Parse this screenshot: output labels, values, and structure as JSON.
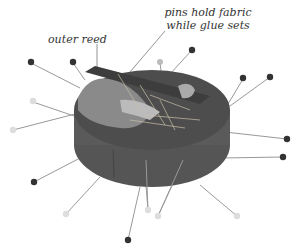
{
  "illustration": {
    "subject": "fabric-covered oval basket base with pins",
    "labels": {
      "pins": [
        "pins hold fabric",
        "while glue sets"
      ],
      "reed": "outer reed"
    },
    "colors": {
      "background": "#ffffff",
      "fabric_dark": "#4a4a4a",
      "fabric_side": "#5e5e5e",
      "fabric_light": "#8c8c8c",
      "pin_dark": "#333333",
      "pin_light": "#dddddd",
      "pin_shaft": "#888888",
      "label_text": "#333333"
    }
  }
}
